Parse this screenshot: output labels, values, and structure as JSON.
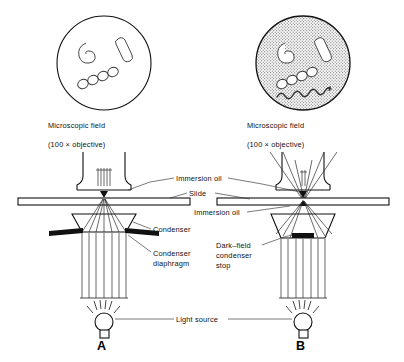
{
  "figure": {
    "panels": [
      {
        "letter": "A",
        "kind": "bright-field",
        "field_caption_line1": "Microscopic field",
        "field_caption_line2": "(100 × objective)",
        "field_background": "white",
        "organisms": [
          "curved comma-shaped bacterium",
          "rod bacillus",
          "streptococcus chain of four cocci"
        ]
      },
      {
        "letter": "B",
        "kind": "dark-field",
        "field_caption_line1": "Microscopic field",
        "field_caption_line2": "(100 × objective)",
        "field_background": "stippled gray",
        "organisms": [
          "curved comma-shaped bacterium",
          "rod bacillus",
          "streptococcus chain of four cocci",
          "spirochete"
        ]
      }
    ],
    "labels": {
      "immersion_oil_top": "Immersion oil",
      "slide": "Slide",
      "immersion_oil_bottom": "Immersion oil",
      "condenser": "Condenser",
      "condenser_diaphragm_line1": "Condenser",
      "condenser_diaphragm_line2": "diaphragm",
      "dark_field_stop_line1": "Dark–field",
      "dark_field_stop_line2": "condenser",
      "dark_field_stop_line3": "stop",
      "light_source": "Light source"
    },
    "colors": {
      "ink": "#111111",
      "leader": "#333333",
      "stipple": "#8a8a8a",
      "paper": "#ffffff"
    }
  }
}
